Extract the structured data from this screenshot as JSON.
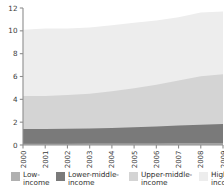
{
  "chart_data": {
    "type": "area",
    "stacked": true,
    "title": "",
    "subtitle": "",
    "xlabel": "",
    "ylabel": "",
    "x": [
      2000,
      2001,
      2002,
      2003,
      2004,
      2005,
      2006,
      2007,
      2008,
      2009
    ],
    "xtick_labels": [
      "2000",
      "2001",
      "2002",
      "2003",
      "2004",
      "2005",
      "2006",
      "2007",
      "2008",
      "2009"
    ],
    "ytick_labels": [
      "0",
      "2",
      "4",
      "6",
      "8",
      "10",
      "12"
    ],
    "ytick_values": [
      0,
      2,
      4,
      6,
      8,
      10,
      12
    ],
    "ylim": [
      0,
      12
    ],
    "xlim": [
      2000,
      2009
    ],
    "grid": false,
    "legend_position": "bottom",
    "series": [
      {
        "name": "Low-income",
        "color": "#b0b0b0",
        "values": [
          0.12,
          0.12,
          0.12,
          0.13,
          0.13,
          0.14,
          0.14,
          0.15,
          0.15,
          0.16
        ]
      },
      {
        "name": "Lower-middle-income",
        "color": "#7a7a7a",
        "values": [
          1.28,
          1.28,
          1.3,
          1.32,
          1.37,
          1.42,
          1.48,
          1.55,
          1.63,
          1.68
        ]
      },
      {
        "name": "Upper-middle-income",
        "color": "#d4d4d4",
        "values": [
          2.9,
          2.9,
          2.95,
          3.05,
          3.2,
          3.4,
          3.65,
          3.95,
          4.25,
          4.36
        ]
      },
      {
        "name": "High-income",
        "color": "#ededed",
        "values": [
          5.8,
          5.9,
          5.83,
          5.8,
          5.8,
          5.74,
          5.63,
          5.55,
          5.57,
          5.5
        ]
      }
    ],
    "stack_tops": {
      "low_income": [
        0.12,
        0.12,
        0.12,
        0.13,
        0.13,
        0.14,
        0.14,
        0.15,
        0.15,
        0.16
      ],
      "lower_middle": [
        1.4,
        1.4,
        1.42,
        1.45,
        1.5,
        1.56,
        1.62,
        1.7,
        1.78,
        1.84
      ],
      "upper_middle": [
        4.3,
        4.3,
        4.37,
        4.5,
        4.7,
        4.96,
        5.27,
        5.65,
        6.03,
        6.2
      ],
      "high_income": [
        10.1,
        10.2,
        10.2,
        10.3,
        10.5,
        10.7,
        10.9,
        11.2,
        11.6,
        11.7
      ]
    }
  },
  "axis": {
    "y_ticks": [
      "0",
      "2",
      "4",
      "6",
      "8",
      "10",
      "12"
    ],
    "x_ticks": [
      "2000",
      "2001",
      "2002",
      "2003",
      "2004",
      "2005",
      "2006",
      "2007",
      "2008",
      "2009"
    ]
  },
  "legend": {
    "items": [
      {
        "label": "Low-\nincome",
        "color": "#b0b0b0"
      },
      {
        "label": "Lower-middle-\nincome",
        "color": "#7a7a7a"
      },
      {
        "label": "Upper-middle-\nincome",
        "color": "#d4d4d4"
      },
      {
        "label": "High-\nincome",
        "color": "#ededed"
      }
    ]
  },
  "colors": {
    "axis": "#8d8d8d",
    "text": "#2f2f2f",
    "background": "#ffffff"
  }
}
